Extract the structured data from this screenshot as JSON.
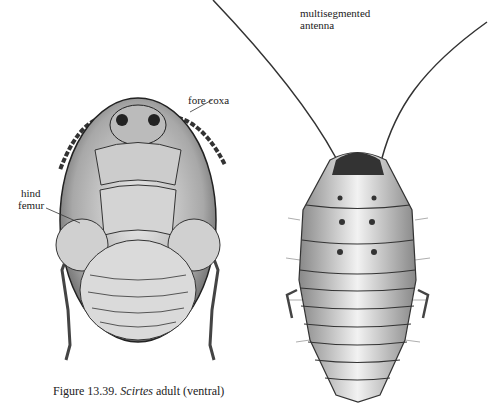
{
  "figure": {
    "caption_prefix": "Figure 13.39.",
    "caption_genus": "Scirtes",
    "caption_rest": "adult (ventral)"
  },
  "labels": {
    "fore_coxa": "fore coxa",
    "hind_femur_line1": "hind",
    "hind_femur_line2": "femur",
    "antenna_line1": "multisegmented",
    "antenna_line2": "antenna"
  },
  "colors": {
    "ink": "#222222",
    "shade_dark": "#555555",
    "shade_mid": "#999999",
    "shade_light": "#d8d8d8",
    "background": "#ffffff"
  }
}
